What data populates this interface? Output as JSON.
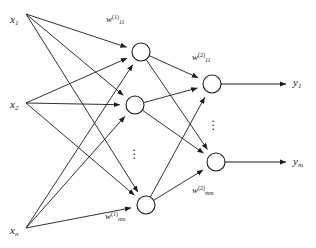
{
  "diagram": {
    "background": "#fefefe",
    "stroke": "#1b1b1b",
    "node_fill": "#ffffff"
  },
  "layers": {
    "input": {
      "labels": [
        {
          "id": "x1",
          "base": "x",
          "sub": "1",
          "x": 10,
          "y": 14
        },
        {
          "id": "x2",
          "base": "x",
          "sub": "2",
          "x": 10,
          "y": 99
        },
        {
          "id": "xn",
          "base": "x",
          "sub": "n",
          "x": 10,
          "y": 225
        }
      ],
      "anchors": [
        [
          26,
          14
        ],
        [
          26,
          103
        ],
        [
          26,
          228
        ]
      ]
    },
    "hidden": {
      "nodes": [
        {
          "id": "h1",
          "cx": 141,
          "cy": 52,
          "r": 9
        },
        {
          "id": "h2",
          "cx": 135,
          "cy": 105,
          "r": 9
        },
        {
          "id": "hm",
          "cx": 146,
          "cy": 205,
          "r": 9
        }
      ],
      "ellipsis": {
        "x": 132,
        "y": 148,
        "dots": 3
      }
    },
    "output": {
      "nodes": [
        {
          "id": "o1",
          "cx": 212,
          "cy": 84,
          "r": 9
        },
        {
          "id": "om",
          "cx": 216,
          "cy": 162,
          "r": 9
        }
      ],
      "ellipsis": {
        "x": 211,
        "y": 119,
        "dots": 3
      },
      "labels": [
        {
          "id": "y1",
          "base": "y",
          "sub": "1",
          "x": 293,
          "y": 77
        },
        {
          "id": "ym",
          "base": "y",
          "sub": "m",
          "x": 293,
          "y": 156
        }
      ],
      "arrow_end_x": 286
    }
  },
  "weights": [
    {
      "id": "w11-layer1",
      "base": "w",
      "sub": "11",
      "sup": "(1)",
      "x": 106,
      "y": 14
    },
    {
      "id": "w11-layer2",
      "base": "w",
      "sub": "11",
      "sup": "(2)",
      "x": 192,
      "y": 52
    },
    {
      "id": "wnm-layer1",
      "base": "w",
      "sub": "nm",
      "sup": "(1)",
      "x": 105,
      "y": 211
    },
    {
      "id": "wmm-layer2",
      "base": "w",
      "sub": "mm",
      "sup": "(2)",
      "x": 192,
      "y": 185
    }
  ],
  "edges": {
    "input_to_hidden": [
      [
        0,
        0
      ],
      [
        0,
        1
      ],
      [
        0,
        2
      ],
      [
        1,
        0
      ],
      [
        1,
        1
      ],
      [
        1,
        2
      ],
      [
        2,
        0
      ],
      [
        2,
        1
      ],
      [
        2,
        2
      ]
    ],
    "hidden_to_output": [
      [
        0,
        0
      ],
      [
        0,
        1
      ],
      [
        1,
        0
      ],
      [
        1,
        1
      ],
      [
        2,
        0
      ],
      [
        2,
        1
      ]
    ]
  }
}
